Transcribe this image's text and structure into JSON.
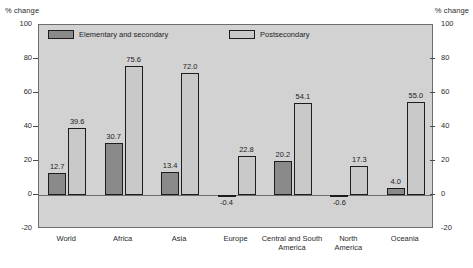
{
  "axis_caption_left": "% change",
  "axis_caption_right": "% change",
  "legend": {
    "elementary_label": "Elementary and secondary",
    "postsecondary_label": "Postsecondary"
  },
  "colors": {
    "elementary": "#8a8a8a",
    "postsecondary": "#c9c9c9",
    "plot_background": "#d2d2d2",
    "frame": "#6d6d6d",
    "bar_outline": "#1d1d1d"
  },
  "chart_data": {
    "type": "bar",
    "title": "",
    "xlabel": "",
    "ylabel": "% change",
    "ylim": [
      -20,
      100
    ],
    "yticks": [
      -20,
      0,
      20,
      40,
      60,
      80,
      100
    ],
    "ytick_labels": [
      "-20",
      "0",
      "20",
      "40",
      "60",
      "80",
      "100"
    ],
    "grid": false,
    "legend_position": "top-inside",
    "dual_y_axis": true,
    "categories": [
      "World",
      "Africa",
      "Asia",
      "Europe",
      "Central and South\nAmerica",
      "North\nAmerica",
      "Oceania"
    ],
    "series": [
      {
        "name": "Elementary and secondary",
        "color": "#8a8a8a",
        "values": [
          12.7,
          30.7,
          13.4,
          -0.4,
          20.2,
          -0.6,
          4.0
        ],
        "labels": [
          "12.7",
          "30.7",
          "13.4",
          "-0.4",
          "20.2",
          "-0.6",
          "4.0"
        ]
      },
      {
        "name": "Postsecondary",
        "color": "#c9c9c9",
        "values": [
          39.6,
          75.6,
          72.0,
          22.8,
          54.1,
          17.3,
          55.0
        ],
        "labels": [
          "39.6",
          "75.6",
          "72.0",
          "22.8",
          "54.1",
          "17.3",
          "55.0"
        ]
      }
    ]
  }
}
